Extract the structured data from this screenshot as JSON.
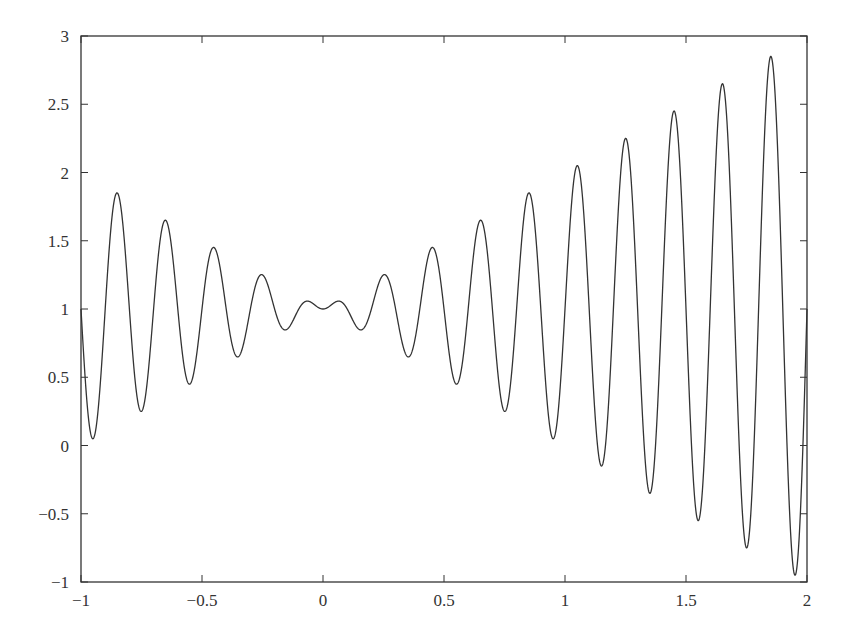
{
  "chart_data": {
    "type": "line",
    "title": "",
    "xlabel": "",
    "ylabel": "",
    "function": "f(x) = x*sin(10*pi*x) + 1",
    "xlim": [
      -1,
      2
    ],
    "ylim": [
      -1,
      3
    ],
    "grid": false,
    "legend": null,
    "x_ticks": [
      -1,
      -0.5,
      0,
      0.5,
      1,
      1.5,
      2
    ],
    "x_tick_labels": [
      "−1",
      "−0.5",
      "0",
      "0.5",
      "1",
      "1.5",
      "2"
    ],
    "y_ticks": [
      -1,
      -0.5,
      0,
      0.5,
      1,
      1.5,
      2,
      2.5,
      3
    ],
    "y_tick_labels": [
      "−1",
      "−0.5",
      "0",
      "0.5",
      "1",
      "1.5",
      "2",
      "2.5",
      "3"
    ],
    "line_color": "#333333",
    "series": [
      {
        "name": "f(x)",
        "sample_points": [
          {
            "x": -0.95,
            "y": 0.05
          },
          {
            "x": -0.85,
            "y": 1.85
          },
          {
            "x": -0.75,
            "y": 0.25
          },
          {
            "x": -0.65,
            "y": 1.65
          },
          {
            "x": -0.55,
            "y": 0.45
          },
          {
            "x": -0.45,
            "y": 1.45
          },
          {
            "x": -0.35,
            "y": 0.65
          },
          {
            "x": -0.25,
            "y": 1.25
          },
          {
            "x": -0.15,
            "y": 0.85
          },
          {
            "x": -0.05,
            "y": 1.05
          },
          {
            "x": 0.0,
            "y": 1.0
          },
          {
            "x": 0.05,
            "y": 1.05
          },
          {
            "x": 0.15,
            "y": 0.85
          },
          {
            "x": 0.25,
            "y": 1.25
          },
          {
            "x": 0.35,
            "y": 0.65
          },
          {
            "x": 0.45,
            "y": 1.45
          },
          {
            "x": 0.55,
            "y": 0.45
          },
          {
            "x": 0.65,
            "y": 1.65
          },
          {
            "x": 0.75,
            "y": 0.25
          },
          {
            "x": 0.85,
            "y": 1.85
          },
          {
            "x": 0.95,
            "y": 0.05
          },
          {
            "x": 1.05,
            "y": 2.05
          },
          {
            "x": 1.15,
            "y": -0.15
          },
          {
            "x": 1.25,
            "y": 2.25
          },
          {
            "x": 1.35,
            "y": -0.35
          },
          {
            "x": 1.45,
            "y": 2.45
          },
          {
            "x": 1.55,
            "y": -0.55
          },
          {
            "x": 1.65,
            "y": 2.65
          },
          {
            "x": 1.75,
            "y": -0.75
          },
          {
            "x": 1.85,
            "y": 2.85
          },
          {
            "x": 1.95,
            "y": -0.95
          },
          {
            "x": 2.0,
            "y": 1.0
          }
        ]
      }
    ]
  },
  "layout": {
    "plot_left": 81,
    "plot_right": 807,
    "plot_top": 36,
    "plot_bottom": 582
  }
}
